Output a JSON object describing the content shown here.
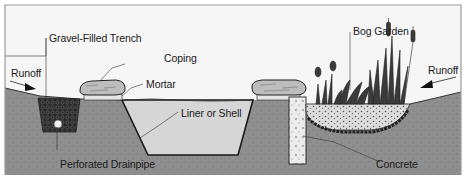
{
  "diagram": {
    "type": "cross-section illustration",
    "labels": {
      "gravel_trench": "Gravel-Filled Trench",
      "runoff_left": "Runoff",
      "coping": "Coping",
      "mortar": "Mortar",
      "liner": "Liner or Shell",
      "drainpipe": "Perforated Drainpipe",
      "bog_garden": "Bog Garden",
      "runoff_right": "Runoff",
      "concrete": "Concrete"
    },
    "colors": {
      "ground": "#8e8e8e",
      "water": "#d6d6d6",
      "gravel_dark": "#2b2b2b",
      "stone": "#bdbdbd",
      "mortar": "#e6e6e6",
      "concrete": "#eeeeee",
      "frame": "#9a9a9a",
      "plants": "#3a3a3a"
    }
  }
}
